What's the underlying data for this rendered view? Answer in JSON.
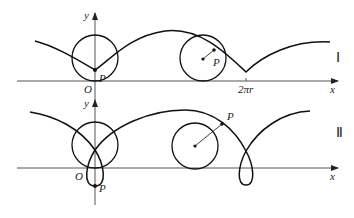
{
  "figure": {
    "panel_1": {
      "numeral": "Ⅰ",
      "x_axis_label": "x",
      "y_axis_label": "y",
      "origin_label": "O",
      "point_label_at_origin": "P",
      "point_label_rolling": "P",
      "tick_label": "2πr",
      "description": "Curtate cycloid traced by point P inside a circle rolling along x-axis"
    },
    "panel_2": {
      "numeral": "Ⅱ",
      "x_axis_label": "x",
      "y_axis_label": "y",
      "origin_label": "O",
      "point_label_at_origin": "P",
      "point_label_rolling": "P",
      "description": "Prolate cycloid traced by point P outside a circle rolling along x-axis, forming loops"
    }
  }
}
